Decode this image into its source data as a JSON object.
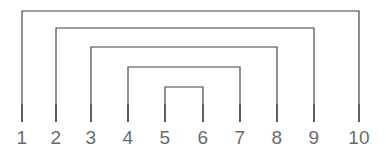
{
  "diagram": {
    "background_color": "#ffffff",
    "line_color": "#3f3f3f",
    "label_color": "#6b6b6b",
    "points": [
      {
        "label": "1",
        "x": 22
      },
      {
        "label": "2",
        "x": 56
      },
      {
        "label": "3",
        "x": 91
      },
      {
        "label": "4",
        "x": 128
      },
      {
        "label": "5",
        "x": 165
      },
      {
        "label": "6",
        "x": 203
      },
      {
        "label": "7",
        "x": 240
      },
      {
        "label": "8",
        "x": 277
      },
      {
        "label": "9",
        "x": 314
      },
      {
        "label": "10",
        "x": 359
      }
    ],
    "baseline_y": 122,
    "label_y": 128,
    "arcs": [
      {
        "name": "arc-1-10",
        "from": "1",
        "to": "10",
        "x1": 22,
        "x2": 359,
        "top_y": 11
      },
      {
        "name": "arc-2-9",
        "from": "2",
        "to": "9",
        "x1": 56,
        "x2": 314,
        "top_y": 28
      },
      {
        "name": "arc-3-8",
        "from": "3",
        "to": "8",
        "x1": 91,
        "x2": 277,
        "top_y": 47
      },
      {
        "name": "arc-4-7",
        "from": "4",
        "to": "7",
        "x1": 128,
        "x2": 240,
        "top_y": 67
      },
      {
        "name": "arc-5-6",
        "from": "5",
        "to": "6",
        "x1": 165,
        "x2": 203,
        "top_y": 87
      }
    ]
  },
  "chart_data": {
    "type": "diagram",
    "categories": [
      "1",
      "2",
      "3",
      "4",
      "5",
      "6",
      "7",
      "8",
      "9",
      "10"
    ],
    "pairs": [
      [
        1,
        10
      ],
      [
        2,
        9
      ],
      [
        3,
        8
      ],
      [
        4,
        7
      ],
      [
        5,
        6
      ]
    ],
    "nesting_depth": 5,
    "crossings": 0,
    "xlabel": "",
    "ylabel": "",
    "grid": false,
    "legend": "none"
  }
}
